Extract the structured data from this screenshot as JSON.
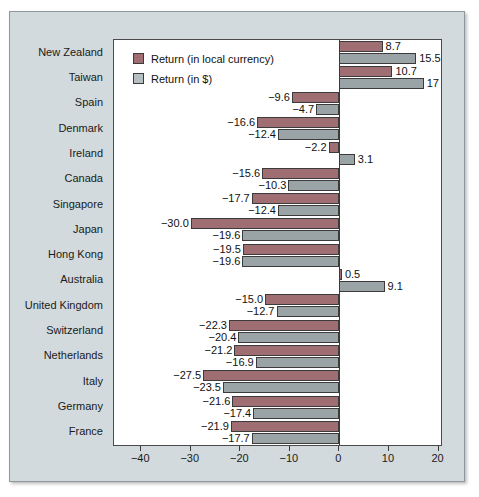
{
  "chart_data": {
    "type": "bar",
    "orientation": "horizontal",
    "title": "",
    "xlabel": "",
    "ylabel": "",
    "xlim": [
      -45.5,
      20.5
    ],
    "ticks": [
      -40,
      -30,
      -20,
      -10,
      0,
      10,
      20
    ],
    "tick_labels": [
      "−40",
      "−30",
      "−20",
      "−10",
      "0",
      "10",
      "20"
    ],
    "grid": false,
    "legend_position": "top-left-inside",
    "categories": [
      "New Zealand",
      "Taiwan",
      "Spain",
      "Denmark",
      "Ireland",
      "Canada",
      "Singapore",
      "Japan",
      "Hong Kong",
      "Australia",
      "United Kingdom",
      "Switzerland",
      "Netherlands",
      "Italy",
      "Germany",
      "France"
    ],
    "series": [
      {
        "name": "Return (in local currency)",
        "color": "#9e6e72",
        "values": [
          8.7,
          10.7,
          -9.6,
          -16.6,
          -2.2,
          -15.6,
          -17.7,
          -30.0,
          -19.5,
          0.5,
          -15.0,
          -22.3,
          -21.2,
          -27.5,
          -21.6,
          -21.9
        ],
        "labels": [
          "8.7",
          "10.7",
          "−9.6",
          "−16.6",
          "−2.2",
          "−15.6",
          "−17.7",
          "−30.0",
          "−19.5",
          "0.5",
          "−15.0",
          "−22.3",
          "−21.2",
          "−27.5",
          "−21.6",
          "−21.9"
        ]
      },
      {
        "name": "Return (in $)",
        "color": "#9aa4a6",
        "values": [
          15.5,
          17.0,
          -4.7,
          -12.4,
          3.1,
          -10.3,
          -12.4,
          -19.6,
          -19.6,
          9.1,
          -12.7,
          -20.4,
          -16.9,
          -23.5,
          -17.4,
          -17.7
        ],
        "labels": [
          "15.5",
          "17",
          "−4.7",
          "−12.4",
          "3.1",
          "−10.3",
          "−12.4",
          "−19.6",
          "−19.6",
          "9.1",
          "−12.7",
          "−20.4",
          "−16.9",
          "−23.5",
          "−17.4",
          "−17.7"
        ]
      }
    ]
  },
  "legend": {
    "items": [
      {
        "label": "Return (in local currency)",
        "swatch": "local"
      },
      {
        "label": "Return (in $)",
        "swatch": "usd"
      }
    ]
  },
  "colors": {
    "local_currency_bar": "#9e6e72",
    "usd_bar": "#9aa4a6",
    "panel_background": "#d2dadd",
    "plot_background": "#ffffff",
    "axis": "#3a3a3a"
  }
}
